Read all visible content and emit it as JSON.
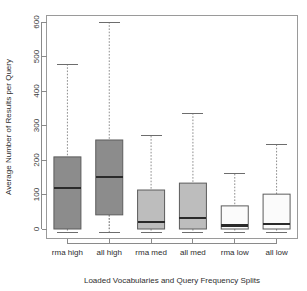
{
  "chart_data": {
    "type": "box",
    "title": "",
    "xlabel": "Loaded Vocabularies and Query Frequency Splits",
    "ylabel": "Average Number of Results per Query",
    "categories": [
      "rma high",
      "all high",
      "rma med",
      "all med",
      "rma low",
      "all low"
    ],
    "ylim": [
      0,
      620
    ],
    "yticks": [
      0,
      100,
      200,
      300,
      400,
      500,
      600
    ],
    "ytick_labels": [
      "0",
      "100",
      "200",
      "300",
      "400",
      "500",
      "600"
    ],
    "grid": false,
    "legend": "none",
    "boxes": [
      {
        "category": "rma high",
        "whisker_low": 0,
        "q1": 0,
        "median": 118,
        "q3": 209,
        "whisker_high": 478,
        "fill": "#8c8c8c"
      },
      {
        "category": "all high",
        "whisker_low": 0,
        "q1": 41,
        "median": 151,
        "q3": 258,
        "whisker_high": 600,
        "fill": "#8c8c8c"
      },
      {
        "category": "rma med",
        "whisker_low": 0,
        "q1": 0,
        "median": 20,
        "q3": 113,
        "whisker_high": 270,
        "fill": "#bdbdbd"
      },
      {
        "category": "all med",
        "whisker_low": 0,
        "q1": 0,
        "median": 32,
        "q3": 133,
        "whisker_high": 336,
        "fill": "#bdbdbd"
      },
      {
        "category": "rma low",
        "whisker_low": 0,
        "q1": 0,
        "median": 10,
        "q3": 67,
        "whisker_high": 160,
        "fill": "#fbfbfb"
      },
      {
        "category": "all low",
        "whisker_low": 0,
        "q1": 0,
        "median": 15,
        "q3": 101,
        "whisker_high": 245,
        "fill": "#fbfbfb"
      }
    ]
  },
  "colors": {
    "background": "#ffffff",
    "frame": "#9a9a9a",
    "axis": "#8a8a8a",
    "median": "#2a2a2a",
    "whisker": "#8d8d8d",
    "text": "#2e2e2e"
  }
}
